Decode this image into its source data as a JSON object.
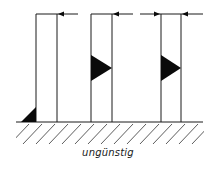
{
  "caption": "ungünstig",
  "colors": {
    "line": "#1a1a1a",
    "fill": "#0a0a0a",
    "background": "#ffffff"
  },
  "members": [
    {
      "name": "member-1",
      "weld": "fillet-at-base-outer",
      "force_arrows": [
        "left"
      ]
    },
    {
      "name": "member-2",
      "weld": "triangle-mid-height",
      "force_arrows": [
        "left"
      ]
    },
    {
      "name": "member-3",
      "weld": "triangle-mid-height",
      "force_arrows": [
        "right",
        "left"
      ]
    }
  ]
}
